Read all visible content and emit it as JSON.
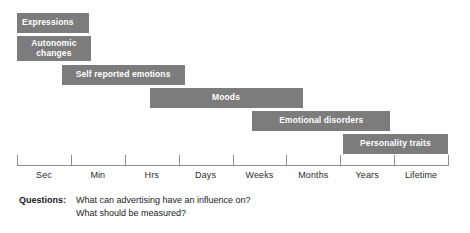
{
  "chart_data": {
    "type": "bar",
    "title": "",
    "xlabel": "",
    "ylabel": "",
    "orientation": "horizontal",
    "grid": false,
    "legend": null,
    "axis_scale": "logarithmic-time",
    "categories": [
      "Sec",
      "Min",
      "Hrs",
      "Days",
      "Weeks",
      "Months",
      "Years",
      "Lifetime"
    ],
    "tick_labels": [
      "Sec",
      "Min",
      "Hrs",
      "Days",
      "Weeks",
      "Months",
      "Years",
      "Lifetime"
    ],
    "bar_color": "#7c7c7c",
    "bar_text_color": "#ffffff",
    "axis_color": "#8e8e8e",
    "bars": [
      {
        "label": "Expressions",
        "start_category": "Sec",
        "end_category": "Sec",
        "start_frac": 0.0,
        "end_frac": 1.33,
        "row": 0,
        "align": "left"
      },
      {
        "label": "Autonomic\nchanges",
        "label_text": "Autonomic changes",
        "start_category": "Sec",
        "end_category": "Sec",
        "start_frac": 0.0,
        "end_frac": 1.37,
        "row": 1,
        "align": "center"
      },
      {
        "label": "Self reported emotions",
        "start_category": "Min",
        "end_category": "Hrs",
        "start_frac": 0.83,
        "end_frac": 3.11,
        "row": 2,
        "align": "center"
      },
      {
        "label": "Moods",
        "start_category": "Hrs",
        "end_category": "Weeks",
        "start_frac": 2.46,
        "end_frac": 5.3,
        "row": 3,
        "align": "center"
      },
      {
        "label": "Emotional disorders",
        "start_category": "Weeks",
        "end_category": "Years",
        "start_frac": 4.37,
        "end_frac": 6.93,
        "row": 4,
        "align": "center"
      },
      {
        "label": "Personality traits",
        "start_category": "Years",
        "end_category": "Lifetime",
        "start_frac": 6.05,
        "end_frac": 8.0,
        "row": 5,
        "align": "center"
      }
    ]
  },
  "questions": {
    "label": "Questions:",
    "lines": [
      "What can advertising have an influence on?",
      "What should be measured?"
    ]
  }
}
